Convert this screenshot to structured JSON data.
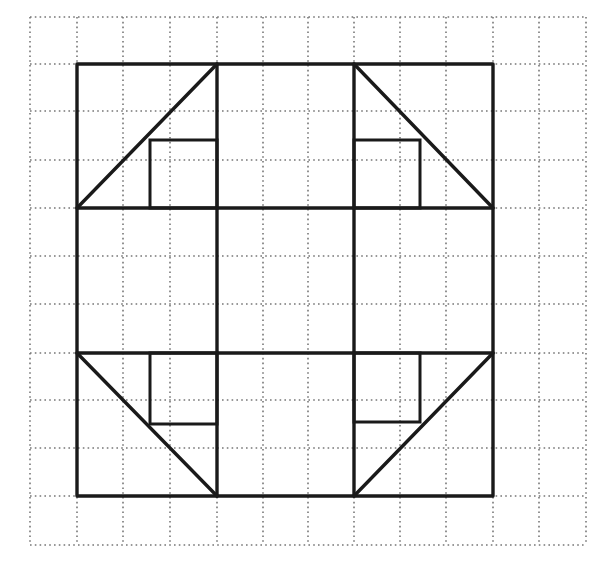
{
  "diagram": {
    "title": "",
    "type": "quilt-block-on-dotted-grid",
    "canvas": {
      "width": 609,
      "height": 561,
      "background": "#ffffff"
    },
    "colors": {
      "grid": "#777777",
      "shape": "#1a1a1a"
    },
    "grid": {
      "columns": 12,
      "rows": 11,
      "x_lines": [
        30,
        77,
        123,
        170,
        217,
        263,
        308,
        354,
        400,
        446,
        493,
        539,
        586
      ],
      "y_lines": [
        17,
        64,
        111,
        160,
        208,
        256,
        304,
        353,
        400,
        448,
        496,
        545
      ],
      "style": "dotted"
    },
    "outer_square": {
      "x1": 77,
      "y1": 64,
      "x2": 493,
      "y2": 496
    },
    "dividers": {
      "vertical": [
        217,
        354
      ],
      "horizontal": [
        208,
        353
      ]
    },
    "corners": [
      {
        "name": "top-left",
        "diagonal": [
          77,
          208,
          217,
          64
        ],
        "inner_rect": [
          150,
          140,
          217,
          208
        ]
      },
      {
        "name": "top-right",
        "diagonal": [
          354,
          64,
          493,
          208
        ],
        "inner_rect": [
          354,
          140,
          420,
          208
        ]
      },
      {
        "name": "bottom-left",
        "diagonal": [
          77,
          353,
          217,
          496
        ],
        "inner_rect": [
          150,
          353,
          217,
          424
        ]
      },
      {
        "name": "bottom-right",
        "diagonal": [
          354,
          496,
          493,
          353
        ],
        "inner_rect": [
          354,
          353,
          420,
          422
        ]
      }
    ]
  }
}
